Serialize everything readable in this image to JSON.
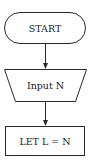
{
  "flowchart": {
    "nodes": [
      {
        "id": "start",
        "type": "terminator",
        "label": "START"
      },
      {
        "id": "input",
        "type": "manual-input",
        "label": "Input N"
      },
      {
        "id": "assign",
        "type": "process",
        "label": "LET L = N"
      }
    ],
    "edges": [
      {
        "from": "start",
        "to": "input"
      },
      {
        "from": "input",
        "to": "assign"
      }
    ]
  },
  "colors": {
    "stroke": "#2a2a2a",
    "background": "#ffffff",
    "text": "#1a1a1a"
  }
}
